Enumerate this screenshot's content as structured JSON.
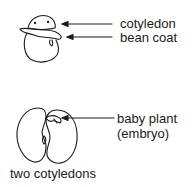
{
  "diagram": {
    "top_bean": {
      "labels": {
        "cotyledon": "cotyledon",
        "bean_coat": "bean coat"
      }
    },
    "bottom_bean": {
      "labels": {
        "embryo_line1": "baby plant",
        "embryo_line2": "(embryo)",
        "caption": "two cotyledons"
      }
    },
    "colors": {
      "ink": "#1a1a1a",
      "background": "#ffffff"
    }
  }
}
